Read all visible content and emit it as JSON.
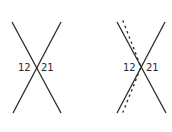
{
  "diagrams": [
    {
      "id": "left",
      "labels": {
        "left": "12",
        "right": "21"
      },
      "lines": [
        {
          "style": "solid",
          "from": [
            12,
            22
          ],
          "to": [
            61,
            113
          ]
        },
        {
          "style": "solid",
          "from": [
            61,
            22
          ],
          "to": [
            13,
            113
          ]
        }
      ]
    },
    {
      "id": "right",
      "labels": {
        "left": "12",
        "right": "21"
      },
      "lines": [
        {
          "style": "solid",
          "from": [
            117,
            22
          ],
          "to": [
            166,
            113
          ]
        },
        {
          "style": "solid",
          "from": [
            165,
            22
          ],
          "to": [
            117,
            113
          ]
        },
        {
          "style": "dotted",
          "points": [
            [
              123,
              21
            ],
            [
              141,
              67
            ],
            [
              123,
              112
            ]
          ]
        }
      ]
    }
  ],
  "colors": {
    "line": "#2a2a2a",
    "background": "#ffffff"
  }
}
